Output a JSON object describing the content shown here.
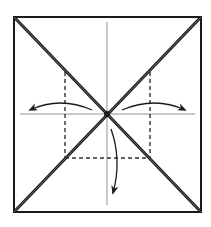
{
  "diagram": {
    "type": "origami-fold-diagram",
    "colors": {
      "background": "#ffffff",
      "line": "#1a1a1a",
      "crease": "#555555",
      "fold_fill": "#6e6e6e"
    },
    "paper_square": {
      "x1": 14,
      "y1": 17,
      "x2": 201,
      "y2": 212
    },
    "center": {
      "x": 107,
      "y": 114
    },
    "creases": [
      {
        "name": "vertical-crease",
        "x1": 107,
        "y1": 22,
        "x2": 107,
        "y2": 205
      },
      {
        "name": "horizontal-crease",
        "x1": 20,
        "y1": 114,
        "x2": 195,
        "y2": 114
      }
    ],
    "diagonal_folds": [
      {
        "name": "diagonal-fold-tl-br",
        "x1": 14,
        "y1": 17,
        "x2": 201,
        "y2": 212
      },
      {
        "name": "diagonal-fold-tr-bl",
        "x1": 201,
        "y1": 17,
        "x2": 14,
        "y2": 212
      }
    ],
    "dashed_valley_folds": [
      {
        "name": "valley-fold-left",
        "x1": 65,
        "y1": 72,
        "x2": 65,
        "y2": 158
      },
      {
        "name": "valley-fold-right",
        "x1": 150,
        "y1": 72,
        "x2": 150,
        "y2": 158
      },
      {
        "name": "valley-fold-bottom",
        "x1": 65,
        "y1": 158,
        "x2": 150,
        "y2": 158
      }
    ],
    "arrows": [
      {
        "name": "fold-arrow-left",
        "direction": "left",
        "path": "M 92 110 Q 60 96 30 110"
      },
      {
        "name": "fold-arrow-right",
        "direction": "right",
        "path": "M 122 110 Q 155 96 185 110"
      },
      {
        "name": "fold-arrow-down",
        "direction": "down",
        "path": "M 111 129 Q 122 160 113 193"
      }
    ]
  }
}
